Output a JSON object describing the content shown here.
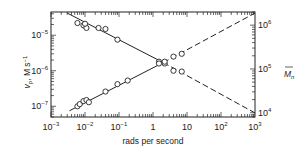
{
  "chart_data": {
    "type": "scatter",
    "title": "",
    "xlabel": "rads per second",
    "ylabel_left": "v_p, M s^-1",
    "ylabel_right": "M̄_n",
    "x_scale": "log",
    "y_scale": "log",
    "xlim": [
      0.001,
      1000
    ],
    "ylim_left": [
      5e-08,
      4.5e-05
    ],
    "ylim_right": [
      8000,
      2000000
    ],
    "x_ticks": [
      "10^-3",
      "10^-2",
      "10^-1",
      "1",
      "10",
      "10^2",
      "10^3"
    ],
    "y_ticks_left": [
      "10^-7",
      "10^-6",
      "10^-5"
    ],
    "y_ticks_right": [
      "10^4",
      "10^5",
      "10^6"
    ],
    "grid": false,
    "legend": null,
    "series": [
      {
        "name": "v_p (decreasing)",
        "axis": "left",
        "marker": "open-circle",
        "points": [
          [
            0.006,
            2.2e-05
          ],
          [
            0.009,
            1.9e-05
          ],
          [
            0.011,
            1.6e-05
          ],
          [
            0.01,
            2.1e-05
          ],
          [
            0.025,
            1.6e-05
          ],
          [
            0.04,
            1.5e-05
          ],
          [
            0.09,
            7.5e-06
          ],
          [
            1.5,
            1.8e-06
          ],
          [
            2.2,
            1.6e-06
          ],
          [
            4,
            1e-06
          ],
          [
            7,
            9.5e-07
          ]
        ],
        "fit_solid": [
          [
            0.003,
            4.2e-05
          ],
          [
            2,
            1.7e-06
          ]
        ],
        "fit_dashed": [
          [
            2,
            1.7e-06
          ],
          [
            1000,
            6.5e-08
          ]
        ]
      },
      {
        "name": "M_n (increasing)",
        "axis": "right",
        "marker": "open-circle",
        "points": [
          [
            0.006,
            1e-07
          ],
          [
            0.007,
            1.15e-07
          ],
          [
            0.009,
            1.4e-07
          ],
          [
            0.011,
            1.5e-07
          ],
          [
            0.013,
            1.3e-07
          ],
          [
            0.04,
            2.6e-07
          ],
          [
            0.09,
            4.2e-07
          ],
          [
            0.18,
            5.3e-07
          ],
          [
            1.5,
            1.6e-06
          ],
          [
            2.2,
            1.8e-06
          ],
          [
            4,
            2.5e-06
          ],
          [
            7,
            3e-06
          ]
        ],
        "fit_solid": [
          [
            0.0035,
            7.5e-08
          ],
          [
            2,
            1.7e-06
          ]
        ],
        "fit_dashed": [
          [
            2,
            1.7e-06
          ],
          [
            1000,
            4.2e-05
          ]
        ]
      }
    ]
  },
  "labels": {
    "xlabel": "rads per second",
    "ylabel_left_main": "v",
    "ylabel_left_sub": "p",
    "ylabel_left_rest": ", M s",
    "ylabel_left_sup": "−1",
    "ylabel_right_main": "M",
    "ylabel_right_sub": "n",
    "x_ticks": [
      {
        "base": "10",
        "exp": "−3"
      },
      {
        "base": "10",
        "exp": "−2"
      },
      {
        "base": "10",
        "exp": "−1"
      },
      {
        "base": "1",
        "exp": ""
      },
      {
        "base": "10",
        "exp": ""
      },
      {
        "base": "10",
        "exp": "2"
      },
      {
        "base": "10",
        "exp": "3"
      }
    ],
    "y_left_ticks": [
      {
        "base": "10",
        "exp": "−5"
      },
      {
        "base": "10",
        "exp": "−6"
      },
      {
        "base": "10",
        "exp": "−7"
      }
    ],
    "y_right_ticks": [
      {
        "base": "10",
        "exp": "6"
      },
      {
        "base": "10",
        "exp": "5"
      },
      {
        "base": "10",
        "exp": "4"
      }
    ]
  },
  "colors": {
    "ink": "#222222",
    "background": "#ffffff"
  }
}
